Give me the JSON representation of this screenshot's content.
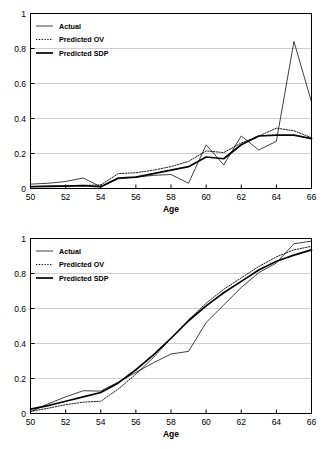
{
  "figure": {
    "background_color": "#ffffff",
    "line_color": "#000000",
    "grid_color": "#b9b9b9"
  },
  "chart_data": [
    {
      "type": "line",
      "panel": "top",
      "title": "",
      "xlabel": "Age",
      "ylabel": "",
      "xlim": [
        50,
        66
      ],
      "ylim": [
        0,
        1
      ],
      "xticks": [
        50,
        52,
        54,
        56,
        58,
        60,
        62,
        64,
        66
      ],
      "xtick_labels": [
        "50",
        "52",
        "54",
        "56",
        "58",
        "60",
        "62",
        "64",
        "66"
      ],
      "yticks": [
        0,
        0.2,
        0.4,
        0.6,
        0.8,
        1
      ],
      "ytick_labels": [
        "0",
        "0.2",
        "0.4",
        "0.6",
        "0.8",
        "1"
      ],
      "grid": "horizontal",
      "legend_position": "upper-left-inside",
      "x": [
        50,
        51,
        52,
        53,
        54,
        55,
        56,
        57,
        58,
        59,
        60,
        61,
        62,
        63,
        64,
        65,
        66
      ],
      "series": [
        {
          "name": "Actual",
          "style": "thin-solid",
          "values": [
            0.025,
            0.03,
            0.04,
            0.06,
            0.01,
            0.055,
            0.065,
            0.075,
            0.08,
            0.03,
            0.25,
            0.135,
            0.3,
            0.22,
            0.27,
            0.84,
            0.495
          ]
        },
        {
          "name": "Predicted OV",
          "style": "dotted",
          "values": [
            0.012,
            0.014,
            0.016,
            0.018,
            0.02,
            0.085,
            0.09,
            0.105,
            0.125,
            0.155,
            0.215,
            0.205,
            0.26,
            0.3,
            0.345,
            0.33,
            0.29
          ]
        },
        {
          "name": "Predicted SDP",
          "style": "thick-solid",
          "values": [
            0.01,
            0.012,
            0.014,
            0.016,
            0.01,
            0.06,
            0.065,
            0.085,
            0.105,
            0.125,
            0.18,
            0.17,
            0.25,
            0.3,
            0.305,
            0.305,
            0.285
          ]
        }
      ]
    },
    {
      "type": "line",
      "panel": "bottom",
      "title": "",
      "xlabel": "Age",
      "ylabel": "",
      "xlim": [
        50,
        66
      ],
      "ylim": [
        0,
        1
      ],
      "xticks": [
        50,
        52,
        54,
        56,
        58,
        60,
        62,
        64,
        66
      ],
      "xtick_labels": [
        "50",
        "52",
        "54",
        "56",
        "58",
        "60",
        "62",
        "64",
        "66"
      ],
      "yticks": [
        0,
        0.2,
        0.4,
        0.6,
        0.8,
        1
      ],
      "ytick_labels": [
        "0",
        "0.2",
        "0.4",
        "0.6",
        "0.8",
        "1"
      ],
      "grid": "horizontal",
      "legend_position": "upper-left-inside",
      "x": [
        50,
        51,
        52,
        53,
        54,
        55,
        56,
        57,
        58,
        59,
        60,
        61,
        62,
        63,
        64,
        65,
        66
      ],
      "series": [
        {
          "name": "Actual",
          "style": "thin-solid",
          "values": [
            0.01,
            0.055,
            0.095,
            0.13,
            0.128,
            0.18,
            0.235,
            0.29,
            0.34,
            0.355,
            0.52,
            0.62,
            0.72,
            0.805,
            0.86,
            0.97,
            0.985
          ]
        },
        {
          "name": "Predicted OV",
          "style": "dotted",
          "values": [
            0.012,
            0.03,
            0.05,
            0.065,
            0.07,
            0.14,
            0.225,
            0.32,
            0.43,
            0.535,
            0.63,
            0.71,
            0.775,
            0.84,
            0.895,
            0.935,
            0.955
          ]
        },
        {
          "name": "Predicted SDP",
          "style": "thick-solid",
          "values": [
            0.025,
            0.045,
            0.07,
            0.095,
            0.12,
            0.175,
            0.25,
            0.335,
            0.43,
            0.53,
            0.615,
            0.69,
            0.755,
            0.82,
            0.87,
            0.905,
            0.935
          ]
        }
      ]
    }
  ],
  "legend": {
    "items": [
      {
        "label": "Actual",
        "style": "thin-solid"
      },
      {
        "label": "Predicted OV",
        "style": "dotted"
      },
      {
        "label": "Predicted SDP",
        "style": "thick-solid"
      }
    ]
  }
}
